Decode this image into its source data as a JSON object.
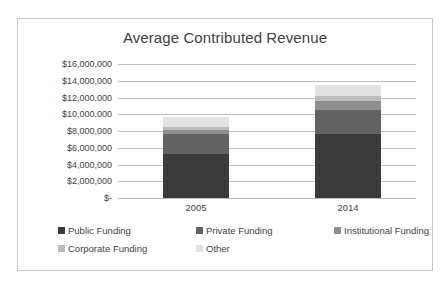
{
  "chart_data": {
    "type": "bar",
    "subtype": "stacked-column",
    "title": "Average Contributed Revenue",
    "xlabel": "",
    "ylabel": "",
    "categories": [
      "2005",
      "2014"
    ],
    "ylim": [
      0,
      16000000
    ],
    "yticks": [
      0,
      2000000,
      4000000,
      6000000,
      8000000,
      10000000,
      12000000,
      14000000,
      16000000
    ],
    "ytick_labels": [
      "$-",
      "$2,000,000",
      "$4,000,000",
      "$6,000,000",
      "$8,000,000",
      "$10,000,000",
      "$12,000,000",
      "$14,000,000",
      "$16,000,000"
    ],
    "grid": true,
    "legend_position": "bottom",
    "series": [
      {
        "name": "Public Funding",
        "color": "#3b3b3b",
        "values": [
          5250000,
          7650000
        ]
      },
      {
        "name": "Private Funding",
        "color": "#626262",
        "values": [
          2400000,
          2900000
        ]
      },
      {
        "name": "Institutional Funding",
        "color": "#8f8f8f",
        "values": [
          450000,
          1050000
        ]
      },
      {
        "name": "Corporate Funding",
        "color": "#bcbcbc",
        "values": [
          350000,
          550000
        ]
      },
      {
        "name": "Other",
        "color": "#e2e2e2",
        "values": [
          1250000,
          1350000
        ]
      }
    ],
    "totals": [
      9700000,
      13500000
    ],
    "colors": {
      "grid": "#bfbfbf",
      "text": "#3f3f3f",
      "title": "#404040",
      "border": "#c9c9c9",
      "background": "#ffffff"
    }
  }
}
